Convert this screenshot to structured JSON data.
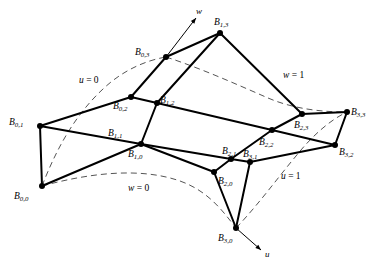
{
  "figure": {
    "stroke_color": "#000000",
    "dash_color": "#555555",
    "background": "#ffffff",
    "width": 383,
    "height": 274
  },
  "control_points": [
    {
      "id": "B00",
      "label_base": "B",
      "label_sub": "0,0",
      "x": 42,
      "y": 186,
      "label_x": 14,
      "label_y": 192
    },
    {
      "id": "B01",
      "label_base": "B",
      "label_sub": "0,1",
      "x": 40,
      "y": 126,
      "label_x": 9,
      "label_y": 118
    },
    {
      "id": "B02",
      "label_base": "B",
      "label_sub": "0,2",
      "x": 131,
      "y": 97,
      "label_x": 113,
      "label_y": 102
    },
    {
      "id": "B03",
      "label_base": "B",
      "label_sub": "0,3",
      "x": 166,
      "y": 57,
      "label_x": 135,
      "label_y": 48
    },
    {
      "id": "B10",
      "label_base": "B",
      "label_sub": "1,0",
      "x": 141,
      "y": 144,
      "label_x": 128,
      "label_y": 150
    },
    {
      "id": "B11",
      "label_base": "B",
      "label_sub": "1,1",
      "x": 141,
      "y": 144,
      "label_x": 108,
      "label_y": 129
    },
    {
      "id": "B12",
      "label_base": "B",
      "label_sub": "1,2",
      "x": 157,
      "y": 103,
      "label_x": 160,
      "label_y": 96
    },
    {
      "id": "B13",
      "label_base": "B",
      "label_sub": "1,3",
      "x": 220,
      "y": 33,
      "label_x": 214,
      "label_y": 18
    },
    {
      "id": "B20",
      "label_base": "B",
      "label_sub": "2,0",
      "x": 214,
      "y": 172,
      "label_x": 218,
      "label_y": 177
    },
    {
      "id": "B21",
      "label_base": "B",
      "label_sub": "2,1",
      "x": 231,
      "y": 159,
      "label_x": 222,
      "label_y": 147
    },
    {
      "id": "B22",
      "label_base": "B",
      "label_sub": "2,2",
      "x": 272,
      "y": 130,
      "label_x": 259,
      "label_y": 138
    },
    {
      "id": "B23",
      "label_base": "B",
      "label_sub": "2,3",
      "x": 302,
      "y": 114,
      "label_x": 294,
      "label_y": 121
    },
    {
      "id": "B30",
      "label_base": "B",
      "label_sub": "3,0",
      "x": 236,
      "y": 228,
      "label_x": 218,
      "label_y": 234
    },
    {
      "id": "B31",
      "label_base": "B",
      "label_sub": "3,1",
      "x": 250,
      "y": 162,
      "label_x": 243,
      "label_y": 150
    },
    {
      "id": "B32",
      "label_base": "B",
      "label_sub": "3,2",
      "x": 335,
      "y": 145,
      "label_x": 339,
      "label_y": 148
    },
    {
      "id": "B33",
      "label_base": "B",
      "label_sub": "3,3",
      "x": 347,
      "y": 112,
      "label_x": 351,
      "label_y": 108
    }
  ],
  "net_edges": [
    [
      "B00",
      "B01"
    ],
    [
      "B01",
      "B02"
    ],
    [
      "B02",
      "B03"
    ],
    [
      "B10",
      "B11"
    ],
    [
      "B11",
      "B12"
    ],
    [
      "B12",
      "B13"
    ],
    [
      "B20",
      "B21"
    ],
    [
      "B21",
      "B22"
    ],
    [
      "B22",
      "B23"
    ],
    [
      "B30",
      "B31"
    ],
    [
      "B31",
      "B32"
    ],
    [
      "B32",
      "B33"
    ],
    [
      "B00",
      "B10"
    ],
    [
      "B10",
      "B20"
    ],
    [
      "B20",
      "B30"
    ],
    [
      "B01",
      "B11"
    ],
    [
      "B11",
      "B21"
    ],
    [
      "B21",
      "B31"
    ],
    [
      "B02",
      "B12"
    ],
    [
      "B12",
      "B22"
    ],
    [
      "B22",
      "B32"
    ],
    [
      "B03",
      "B13"
    ],
    [
      "B13",
      "B23"
    ],
    [
      "B23",
      "B33"
    ]
  ],
  "parameter_curves": [
    {
      "name": "u=0",
      "label_text": "u = 0",
      "var": "u",
      "value": "0",
      "label_x": 79,
      "label_y": 76,
      "path": "M 42 186 C 56 150, 74 116, 103 89 C 124 69, 148 60, 166 57"
    },
    {
      "name": "u=1",
      "label_text": "u = 1",
      "var": "u",
      "value": "1",
      "label_x": 281,
      "label_y": 172,
      "path": "M 236 228 C 258 205, 276 180, 296 156 C 312 136, 330 120, 347 112"
    },
    {
      "name": "w=0",
      "label_text": "w = 0",
      "var": "w",
      "value": "0",
      "label_x": 128,
      "label_y": 184,
      "path": "M 42 186 C 90 173, 140 167, 180 181 C 208 191, 222 210, 236 228"
    },
    {
      "name": "w=1",
      "label_text": "w = 1",
      "var": "w",
      "value": "1",
      "label_x": 283,
      "label_y": 71,
      "path": "M 166 57 C 200 68, 236 84, 268 98 C 296 110, 326 112, 347 112"
    }
  ],
  "axis_arrows": [
    {
      "name": "w-axis",
      "label": "w",
      "x1": 166,
      "y1": 57,
      "x2": 196,
      "y2": 18,
      "label_x": 196,
      "label_y": 7
    },
    {
      "name": "u-axis",
      "label": "u",
      "x1": 236,
      "y1": 228,
      "x2": 261,
      "y2": 250,
      "label_x": 265,
      "label_y": 250
    }
  ]
}
